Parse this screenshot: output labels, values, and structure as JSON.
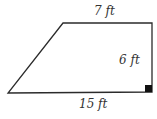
{
  "diagram": {
    "shape": "right trapezoid",
    "labels": {
      "top": "7 ft",
      "height": "6 ft",
      "bottom": "15 ft"
    },
    "colors": {
      "stroke": "#2b2b2b",
      "right_angle_marker": "#111111",
      "text": "#333333"
    }
  }
}
